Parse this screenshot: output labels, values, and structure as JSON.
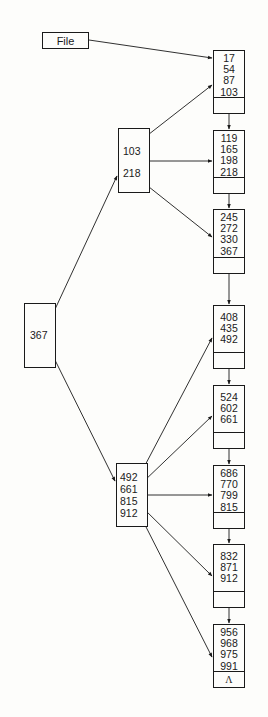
{
  "diagram": {
    "type": "B+ tree",
    "colors": {
      "line": "#1a1a1a",
      "background": "#fdfdfb"
    },
    "file_label": "File",
    "root": {
      "keys": [
        "367"
      ]
    },
    "internal_nodes": [
      {
        "id": "n1",
        "keys": [
          "103",
          "218"
        ]
      },
      {
        "id": "n2",
        "keys": [
          "492",
          "661",
          "815",
          "912"
        ]
      }
    ],
    "leaves": [
      {
        "id": "l1",
        "keys": [
          "17",
          "54",
          "87",
          "103"
        ],
        "next": ""
      },
      {
        "id": "l2",
        "keys": [
          "119",
          "165",
          "198",
          "218"
        ],
        "next": ""
      },
      {
        "id": "l3",
        "keys": [
          "245",
          "272",
          "330",
          "367"
        ],
        "next": ""
      },
      {
        "id": "l4",
        "keys": [
          "408",
          "435",
          "492"
        ],
        "next": ""
      },
      {
        "id": "l5",
        "keys": [
          "524",
          "602",
          "661"
        ],
        "next": ""
      },
      {
        "id": "l6",
        "keys": [
          "686",
          "770",
          "799",
          "815"
        ],
        "next": ""
      },
      {
        "id": "l7",
        "keys": [
          "832",
          "871",
          "912"
        ],
        "next": ""
      },
      {
        "id": "l8",
        "keys": [
          "956",
          "968",
          "975",
          "991"
        ],
        "next": "Λ"
      }
    ]
  }
}
